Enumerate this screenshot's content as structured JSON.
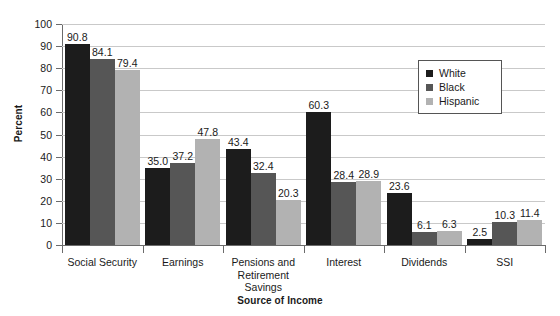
{
  "chart_data": {
    "type": "bar",
    "title": "",
    "xlabel": "Source of Income",
    "ylabel": "Percent",
    "ylim": [
      0,
      100
    ],
    "ytick_step": 10,
    "yticks": [
      "0",
      "10",
      "20",
      "30",
      "40",
      "50",
      "60",
      "70",
      "80",
      "90",
      "100"
    ],
    "grid": true,
    "legend_position": "upper-right-inside",
    "categories": [
      "Social Security",
      "Earnings",
      "Pensions and Retirement Savings",
      "Interest",
      "Dividends",
      "SSI"
    ],
    "category_label_lines": [
      [
        "Social Security"
      ],
      [
        "Earnings"
      ],
      [
        "Pensions and",
        "Retirement",
        "Savings"
      ],
      [
        "Interest"
      ],
      [
        "Dividends"
      ],
      [
        "SSI"
      ]
    ],
    "series": [
      {
        "name": "White",
        "color": "#1c1c1c",
        "values": [
          90.8,
          35.0,
          43.4,
          60.3,
          23.6,
          2.5
        ],
        "labels": [
          "90.8",
          "35.0",
          "43.4",
          "60.3",
          "23.6",
          "2.5"
        ]
      },
      {
        "name": "Black",
        "color": "#565656",
        "values": [
          84.1,
          37.2,
          32.4,
          28.4,
          6.1,
          10.3
        ],
        "labels": [
          "84.1",
          "37.2",
          "32.4",
          "28.4",
          "6.1",
          "10.3"
        ]
      },
      {
        "name": "Hispanic",
        "color": "#b2b2b2",
        "values": [
          79.4,
          47.8,
          20.3,
          28.9,
          6.3,
          11.4
        ],
        "labels": [
          "79.4",
          "47.8",
          "20.3",
          "28.9",
          "6.3",
          "11.4"
        ]
      }
    ]
  },
  "legend": {
    "items": [
      {
        "label": "White",
        "swatch": "series-white"
      },
      {
        "label": "Black",
        "swatch": "series-black"
      },
      {
        "label": "Hispanic",
        "swatch": "series-hispanic"
      }
    ]
  },
  "axis_titles": {
    "y": "Percent",
    "x": "Source of Income"
  },
  "colors": {
    "white_series": "#1c1c1c",
    "black_series": "#565656",
    "hispanic_series": "#b2b2b2",
    "gridline": "#c9c9c9",
    "axis": "#6b6b6b",
    "background": "#ffffff",
    "text": "#1a1a1a"
  }
}
